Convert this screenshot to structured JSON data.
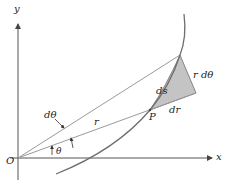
{
  "diagram": {
    "colors": {
      "axis": "#555555",
      "ray": "#9a9a9a",
      "curve": "#6e6e6e",
      "shade": "#c4c4c4",
      "text": "#222222"
    },
    "axes": {
      "x_label": "x",
      "y_label": "y",
      "origin_label": "O"
    },
    "labels": {
      "theta": "θ",
      "d_theta": "dθ",
      "r": "r",
      "point_p": "P",
      "ds": "ds",
      "dr": "dr",
      "r_d_theta": "r dθ"
    },
    "points": {
      "origin": [
        18,
        158
      ],
      "P": [
        150,
        110
      ],
      "Q": [
        180,
        55
      ],
      "R": [
        196,
        93
      ]
    }
  }
}
